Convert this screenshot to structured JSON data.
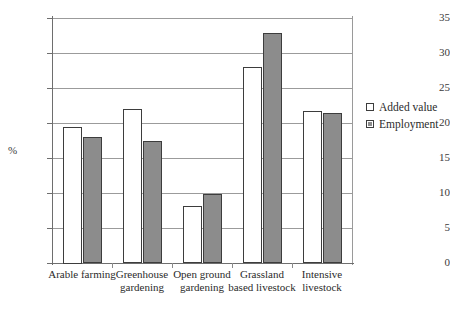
{
  "chart_data": {
    "type": "bar",
    "title": "",
    "xlabel": "",
    "ylabel": "%",
    "ylim": [
      0,
      35
    ],
    "yticks": [
      0,
      5,
      10,
      15,
      20,
      25,
      30,
      35
    ],
    "ytick_labels": [
      "0",
      "5",
      "10",
      "15",
      "20",
      "25",
      "30",
      "35"
    ],
    "grid": true,
    "legend_position": "right",
    "categories": [
      "Arable farming",
      "Greenhouse gardening",
      "Open ground gardening",
      "Grassland based livestock",
      "Intensive livestock"
    ],
    "category_lines": [
      [
        "Arable farming"
      ],
      [
        "Greenhouse",
        "gardening"
      ],
      [
        "Open ground",
        "gardening"
      ],
      [
        "Grassland",
        "based livestock"
      ],
      [
        "Intensive",
        "livestock"
      ]
    ],
    "series": [
      {
        "name": "Added value",
        "color": "#ffffff",
        "values": [
          19.5,
          22.0,
          8.2,
          28.0,
          21.7
        ]
      },
      {
        "name": "Employment",
        "color": "#8c8c8c",
        "values": [
          18.0,
          17.4,
          9.8,
          32.8,
          21.4
        ]
      }
    ]
  },
  "legend": {
    "items": [
      {
        "label": "Added value",
        "swatch": "added-value-swatch"
      },
      {
        "label": "Employment",
        "swatch": "employment-swatch"
      }
    ]
  },
  "colors": {
    "added_value": "#ffffff",
    "employment": "#8c8c8c",
    "bar_outline": "#3d3d3d",
    "gridline": "#9b9b9b",
    "axis": "#6e6e6e",
    "text": "#2b2b2b"
  }
}
